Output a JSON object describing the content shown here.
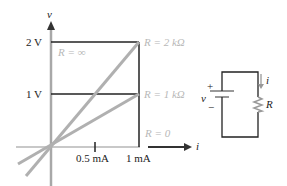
{
  "axes": {
    "y_label": "v",
    "x_label": "i",
    "y_ticks": [
      "2 V",
      "1 V"
    ],
    "x_ticks": [
      "0.5 mA",
      "1 mA"
    ]
  },
  "curves": [
    {
      "label": "R = ∞",
      "color": "#b8b8b8"
    },
    {
      "label": "R = 2 kΩ",
      "color": "#b8b8b8"
    },
    {
      "label": "R = 1 kΩ",
      "color": "#b8b8b8"
    },
    {
      "label": "R = 0",
      "color": "#b8b8b8"
    }
  ],
  "circuit": {
    "source_label": "v",
    "plus": "+",
    "minus": "−",
    "current_label": "i",
    "resistor_label": "R"
  },
  "colors": {
    "axis": "#a8a8a8",
    "line": "#222222",
    "curve": "#b0b0b0",
    "label_gray": "#b8b8b8"
  }
}
